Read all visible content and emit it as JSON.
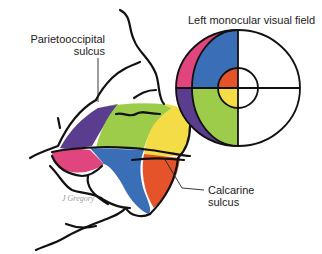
{
  "diagram": {
    "title": "Left monocular visual field",
    "labels": {
      "parietooccipital_line1": "Parietooccipital",
      "parietooccipital_line2": "sulcus",
      "calcarine_line1": "Calcarine",
      "calcarine_line2": "sulcus"
    },
    "signature": "J Gregory",
    "colors": {
      "purple": "#5b3d8f",
      "green": "#9ccc4a",
      "yellow": "#f3dc45",
      "pink": "#e0457e",
      "blue": "#3a6fb8",
      "orange": "#e4532a",
      "outline": "#111111",
      "background": "#ffffff"
    },
    "visual_field_regions": [
      {
        "name": "upper-peripheral-crescent",
        "color": "pink"
      },
      {
        "name": "lower-peripheral-crescent",
        "color": "purple"
      },
      {
        "name": "upper-left-quadrant",
        "color": "blue"
      },
      {
        "name": "lower-left-quadrant",
        "color": "green"
      },
      {
        "name": "upper-central",
        "color": "orange"
      },
      {
        "name": "lower-central",
        "color": "yellow"
      }
    ]
  }
}
